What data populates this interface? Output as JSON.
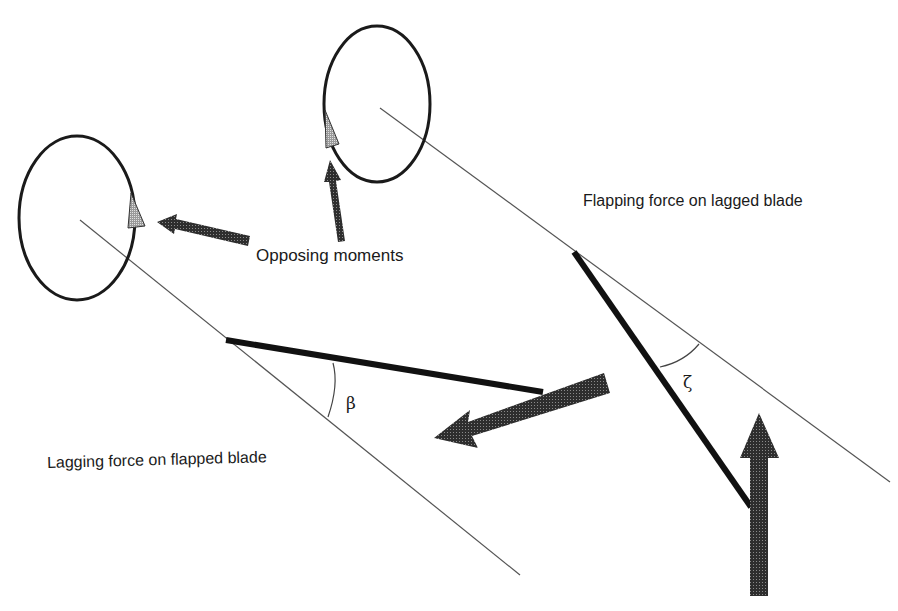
{
  "labels": {
    "opposing_moments": "Opposing moments",
    "flapping_force": "Flapping force on lagged blade",
    "lagging_force": "Lagging force on flapped blade"
  },
  "symbols": {
    "flap_angle": "β",
    "lag_angle": "ζ"
  },
  "colors": {
    "line": "#1a1a1a",
    "thin_line": "#555555",
    "arrow_fill": "#3a3a3a",
    "background": "#ffffff"
  }
}
